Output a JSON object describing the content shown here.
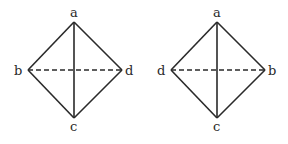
{
  "diagrams": [
    {
      "name": "left-tetrahedron",
      "labels": {
        "top": "a",
        "left": "b",
        "right": "d",
        "bottom": "c"
      },
      "vertices": {
        "top": [
          74,
          22
        ],
        "left": [
          28,
          70
        ],
        "right": [
          122,
          70
        ],
        "bottom": [
          74,
          118
        ]
      }
    },
    {
      "name": "right-tetrahedron",
      "labels": {
        "top": "a",
        "left": "d",
        "right": "b",
        "bottom": "c"
      },
      "vertices": {
        "top": [
          217,
          22
        ],
        "left": [
          171,
          70
        ],
        "right": [
          265,
          70
        ],
        "bottom": [
          217,
          118
        ]
      }
    }
  ],
  "colors": {
    "stroke": "#2a2a2a",
    "background": "#ffffff"
  }
}
